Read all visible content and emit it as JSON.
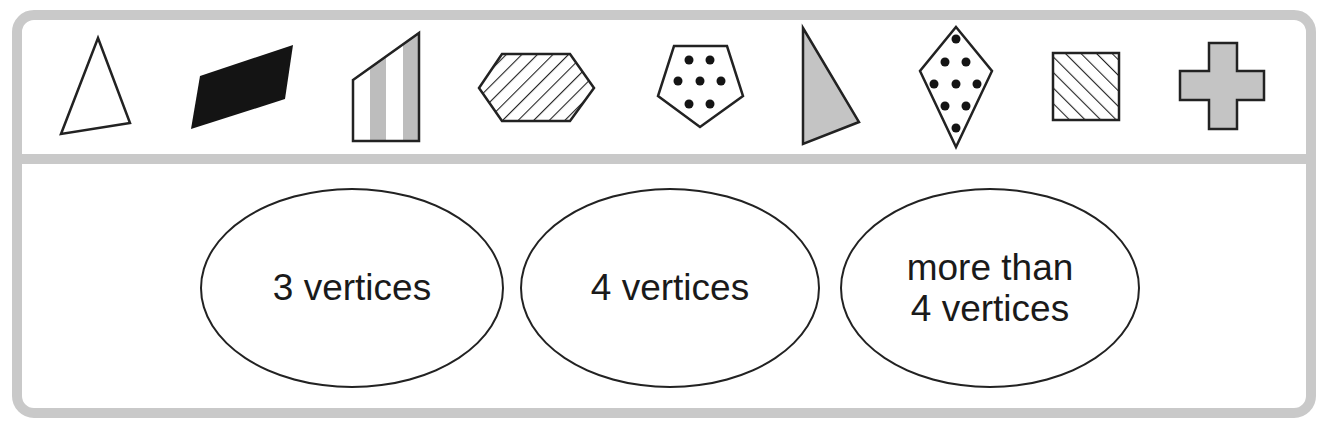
{
  "colors": {
    "frame": "#c9c9c9",
    "outline": "#222222",
    "gray_fill": "#c4c4c4",
    "black_fill": "#141414"
  },
  "shapes": [
    {
      "id": "triangle-outline",
      "vertices": 3,
      "fill": "none"
    },
    {
      "id": "parallelogram-black",
      "vertices": 4,
      "fill": "solid black"
    },
    {
      "id": "quadrilateral-striped",
      "vertices": 4,
      "fill": "vertical gray stripes"
    },
    {
      "id": "hexagon-hatched",
      "vertices": 6,
      "fill": "diagonal hatch"
    },
    {
      "id": "pentagon-dotted",
      "vertices": 5,
      "fill": "7 dots"
    },
    {
      "id": "triangle-gray",
      "vertices": 3,
      "fill": "gray"
    },
    {
      "id": "kite-dotted",
      "vertices": 4,
      "fill": "9 dots"
    },
    {
      "id": "square-hatched",
      "vertices": 4,
      "fill": "diagonal hatch"
    },
    {
      "id": "cross-gray",
      "vertices": 12,
      "fill": "gray"
    }
  ],
  "categories": [
    {
      "line1": "3 vertices",
      "line2": ""
    },
    {
      "line1": "4 vertices",
      "line2": ""
    },
    {
      "line1": "more than",
      "line2": "4 vertices"
    }
  ]
}
